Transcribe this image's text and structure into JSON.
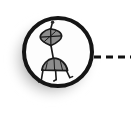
{
  "image": {
    "title": "Circular badge icon with stylized figure and dashed connector",
    "width": 131,
    "height": 123,
    "background_color": "#ffffff"
  },
  "badge": {
    "name": "circular badge",
    "center_x": 58,
    "center_y": 52,
    "radius": 36,
    "ring_color": "#151515",
    "ring_width": 4,
    "fill_color": "#fdfdfd",
    "shadow": {
      "name": "drop shadow glow",
      "color": "#8a8a8a",
      "offset_x": -6,
      "offset_y": 7,
      "blur": 13,
      "opacity": 0.85
    }
  },
  "glyph": {
    "name": "stylized two-part figure",
    "stroke_color": "#1a1a1a",
    "fill_color": "#8d8d8d",
    "parts": [
      {
        "name": "antenna",
        "label": "antenna stem with knob"
      },
      {
        "name": "head",
        "label": "inverted teardrop head with radial lines"
      },
      {
        "name": "neck",
        "label": "neck connector"
      },
      {
        "name": "body",
        "label": "dome body"
      },
      {
        "name": "legs",
        "label": "three thin legs with feet"
      }
    ]
  },
  "connector": {
    "name": "dashed connector line",
    "color": "#101010",
    "y": 57,
    "start_x": 94,
    "end_x": 131,
    "thickness": 3,
    "dash_length": 7,
    "gap_length": 5,
    "dash_count": 3
  }
}
